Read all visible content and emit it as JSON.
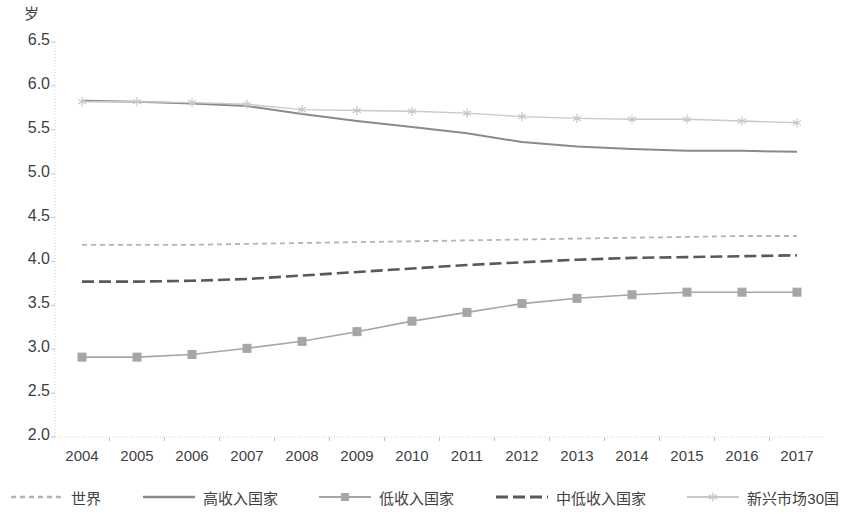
{
  "chart_data": {
    "type": "line",
    "title": "",
    "subtitle": "",
    "xlabel": "",
    "ylabel": "岁",
    "unit_label": "岁",
    "categories": [
      "2004",
      "2005",
      "2006",
      "2007",
      "2008",
      "2009",
      "2010",
      "2011",
      "2012",
      "2013",
      "2014",
      "2015",
      "2016",
      "2017"
    ],
    "ylim": [
      2.0,
      6.5
    ],
    "ytick_labels": [
      "6.5",
      "6.0",
      "5.5",
      "5.0",
      "4.5",
      "4.0",
      "3.5",
      "3.0",
      "2.5",
      "2.0"
    ],
    "ytick_values": [
      6.5,
      6.0,
      5.5,
      5.0,
      4.5,
      4.0,
      3.5,
      3.0,
      2.5,
      2.0
    ],
    "grid": false,
    "legend_position": "bottom",
    "series": [
      {
        "name": "世界",
        "style": "dashed-light",
        "color": "#b5b5b5",
        "marker": "none",
        "values": [
          4.19,
          4.19,
          4.19,
          4.2,
          4.21,
          4.22,
          4.23,
          4.24,
          4.25,
          4.26,
          4.27,
          4.28,
          4.29,
          4.29
        ]
      },
      {
        "name": "高收入国家",
        "style": "solid-dark",
        "color": "#8a8a8a",
        "marker": "none",
        "values": [
          5.83,
          5.82,
          5.8,
          5.77,
          5.68,
          5.6,
          5.53,
          5.46,
          5.36,
          5.31,
          5.28,
          5.26,
          5.26,
          5.25
        ]
      },
      {
        "name": "低收入国家",
        "style": "solid-marker",
        "color": "#a6a6a6",
        "marker": "square",
        "values": [
          2.91,
          2.91,
          2.94,
          3.01,
          3.09,
          3.2,
          3.32,
          3.42,
          3.52,
          3.58,
          3.62,
          3.65,
          3.65,
          3.65
        ]
      },
      {
        "name": "中低收入国家",
        "style": "dashed-dark",
        "color": "#595959",
        "marker": "none",
        "values": [
          3.77,
          3.77,
          3.78,
          3.8,
          3.84,
          3.88,
          3.92,
          3.96,
          3.99,
          4.02,
          4.04,
          4.05,
          4.06,
          4.07
        ]
      },
      {
        "name": "新兴市场30国",
        "style": "solid-light-marker",
        "color": "#c9c9c9",
        "marker": "star",
        "values": [
          5.82,
          5.82,
          5.81,
          5.79,
          5.73,
          5.72,
          5.71,
          5.69,
          5.65,
          5.63,
          5.62,
          5.62,
          5.6,
          5.58
        ]
      }
    ]
  },
  "axis": {
    "unit": "岁"
  },
  "legend": {
    "items": [
      {
        "label": "世界",
        "icon": "dashed-line-icon"
      },
      {
        "label": "高收入国家",
        "icon": "solid-line-icon"
      },
      {
        "label": "低收入国家",
        "icon": "square-marker-line-icon"
      },
      {
        "label": "中低收入国家",
        "icon": "long-dashed-line-icon"
      },
      {
        "label": "新兴市场30国",
        "icon": "star-marker-line-icon"
      }
    ]
  }
}
